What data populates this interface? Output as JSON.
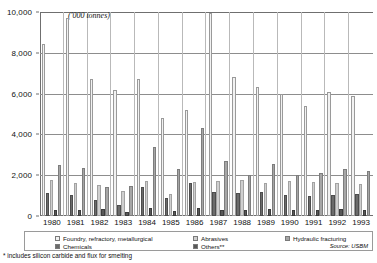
{
  "chart_data": {
    "type": "bar",
    "title": "",
    "unit_note": "('000 tonnes)",
    "xlabel": "",
    "ylabel": "",
    "ylim": [
      0,
      10000
    ],
    "yticks": [
      "0",
      "2,000",
      "4,000",
      "6,000",
      "8,000",
      "10,000"
    ],
    "ytick_values": [
      0,
      2000,
      4000,
      6000,
      8000,
      10000
    ],
    "grid": true,
    "legend_position": "bottom",
    "categories": [
      "1980",
      "1981",
      "1982",
      "1983",
      "1984",
      "1985",
      "1986",
      "1987",
      "1988",
      "1989",
      "1990",
      "1991",
      "1992",
      "1993"
    ],
    "series": [
      {
        "name": "Foundry, refractory, metallurgical",
        "color": "#f2f2f2",
        "values": [
          8450,
          9700,
          6700,
          6200,
          6700,
          4800,
          5200,
          9950,
          6800,
          6300,
          6000,
          5400,
          6100,
          5900
        ]
      },
      {
        "name": "Chemicals",
        "color": "#6b6b6b",
        "values": [
          1150,
          1050,
          800,
          550,
          1400,
          900,
          1600,
          1200,
          1150,
          1200,
          1050,
          1000,
          1050,
          1100
        ]
      },
      {
        "name": "Abrasives",
        "color": "#cfcfcf",
        "values": [
          1750,
          1600,
          1500,
          1250,
          1700,
          1100,
          1650,
          1700,
          1750,
          1600,
          1700,
          1650,
          1600,
          1550
        ]
      },
      {
        "name": "Others**",
        "color": "#585858",
        "values": [
          300,
          300,
          350,
          200,
          400,
          250,
          400,
          300,
          300,
          350,
          300,
          300,
          350,
          300
        ]
      },
      {
        "name": "Hydraulic fracturing",
        "color": "#a6a6a6",
        "values": [
          2500,
          2350,
          1400,
          1450,
          3400,
          2300,
          4300,
          2700,
          2000,
          2550,
          2000,
          2100,
          2300,
          2200
        ]
      }
    ]
  },
  "legend": {
    "items": [
      {
        "label": "Foundry, refractory, metallurgical",
        "swatch": "#f2f2f2"
      },
      {
        "label": "Chemicals",
        "swatch": "#6b6b6b"
      },
      {
        "label": "Abrasives",
        "swatch": "#cfcfcf"
      },
      {
        "label": "Others**",
        "swatch": "#585858"
      },
      {
        "label": "Hydraulic fracturing",
        "swatch": "#a6a6a6"
      }
    ],
    "source": "Source: USBM"
  },
  "footnote": "* includes silicon carbide and flux for smelting"
}
